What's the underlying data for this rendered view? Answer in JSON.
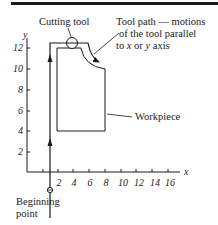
{
  "diagram": {
    "type": "cnc-tool-path-diagram",
    "labels": {
      "cutting_tool": "Cutting tool",
      "tool_path_line1": "Tool path — motions",
      "tool_path_line2": "of the tool parallel",
      "tool_path_line3_pre": "to ",
      "tool_path_line3_x": "x",
      "tool_path_line3_mid": " or ",
      "tool_path_line3_y": "y",
      "tool_path_line3_post": " axis",
      "workpiece": "Workpiece",
      "beginning_line1": "Beginning",
      "beginning_line2": "point"
    },
    "axes": {
      "x_name": "x",
      "y_name": "y",
      "x_ticks": [
        "2",
        "4",
        "6",
        "8",
        "10",
        "12",
        "14",
        "16"
      ],
      "y_ticks": [
        "2",
        "4",
        "6",
        "8",
        "10",
        "12"
      ]
    },
    "colors": {
      "ink": "#1a1a1a",
      "background": "#ffffff"
    }
  }
}
